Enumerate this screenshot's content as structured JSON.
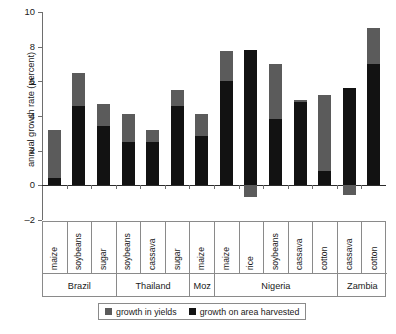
{
  "chart_data": {
    "type": "bar",
    "stacked": true,
    "title": "",
    "xlabel": "",
    "ylabel": "annual growth rate (percent)",
    "ylim": [
      -2,
      10
    ],
    "yticks": [
      -2,
      0,
      2,
      4,
      6,
      8,
      10
    ],
    "ytick_labels": [
      "–2",
      "0",
      "2",
      "4",
      "6",
      "8",
      "10"
    ],
    "grid": false,
    "legend_position": "bottom",
    "categories": [
      "maize",
      "soybeans",
      "sugar",
      "soybeans",
      "cassava",
      "sugar",
      "maize",
      "maize",
      "rice",
      "soybeans",
      "cassava",
      "cotton",
      "cassava",
      "cotton"
    ],
    "groups": [
      {
        "label": "Brazil",
        "span": 3
      },
      {
        "label": "Thailand",
        "span": 3
      },
      {
        "label": "Moz",
        "span": 1
      },
      {
        "label": "Nigeria",
        "span": 5
      },
      {
        "label": "Zambia",
        "span": 2
      }
    ],
    "series": [
      {
        "name": "growth on area harvested",
        "color": "#121212",
        "values": [
          0.45,
          4.6,
          3.4,
          2.5,
          2.5,
          4.6,
          2.85,
          6.0,
          7.8,
          3.85,
          4.8,
          0.8,
          5.6,
          7.0
        ]
      },
      {
        "name": "growth in yields",
        "color": "#5b5b5b",
        "values": [
          2.75,
          1.9,
          1.3,
          1.6,
          0.7,
          0.9,
          1.25,
          1.75,
          -0.7,
          3.15,
          0.15,
          4.4,
          -0.55,
          2.1
        ]
      }
    ],
    "totals": [
      3.2,
      6.5,
      4.7,
      4.1,
      3.2,
      5.5,
      4.1,
      7.75,
      7.8,
      7.0,
      4.95,
      5.2,
      5.6,
      9.1
    ]
  },
  "legend": {
    "items": [
      {
        "label": "growth in yields",
        "color": "#5b5b5b"
      },
      {
        "label": "growth on area harvested",
        "color": "#121212"
      }
    ]
  },
  "footer": {
    "smudge": ""
  }
}
